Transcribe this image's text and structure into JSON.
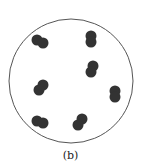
{
  "figure": {
    "label": "(b)",
    "circle": {
      "cx": 71,
      "cy": 81,
      "r": 62,
      "stroke": "#555555"
    },
    "dot_color": "#333333",
    "pairs": [
      {
        "x1": 37,
        "y1": 40,
        "x2": 43,
        "y2": 43
      },
      {
        "x1": 91,
        "y1": 36,
        "x2": 91,
        "y2": 42
      },
      {
        "x1": 93,
        "y1": 66,
        "x2": 91,
        "y2": 72
      },
      {
        "x1": 43,
        "y1": 85,
        "x2": 39,
        "y2": 90
      },
      {
        "x1": 115,
        "y1": 91,
        "x2": 115,
        "y2": 97
      },
      {
        "x1": 37,
        "y1": 121,
        "x2": 43,
        "y2": 123
      },
      {
        "x1": 82,
        "y1": 119,
        "x2": 78,
        "y2": 125
      }
    ]
  }
}
